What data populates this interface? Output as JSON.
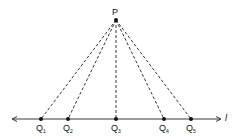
{
  "diagram": {
    "type": "geometry",
    "apex": {
      "label": "P",
      "x": 116,
      "y": 20
    },
    "line": {
      "label": "l",
      "y": 119,
      "x_start": 12,
      "x_end": 221,
      "bidirectional": true
    },
    "points": [
      {
        "label": "Q",
        "sub": "1",
        "x": 41
      },
      {
        "label": "Q",
        "sub": "2",
        "x": 68
      },
      {
        "label": "Q",
        "sub": "3",
        "x": 116
      },
      {
        "label": "Q",
        "sub": "4",
        "x": 164
      },
      {
        "label": "Q",
        "sub": "5",
        "x": 191
      }
    ],
    "colors": {
      "stroke": "#222222",
      "point": "#111111",
      "text": "#111111"
    }
  }
}
